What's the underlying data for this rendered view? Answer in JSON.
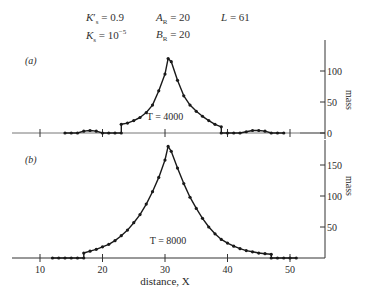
{
  "params": {
    "ks_prime": "K′s = 0.9",
    "ks": "Ks = 10⁻⁵",
    "ar": "AR = 20",
    "br": "BR = 20",
    "l": "L = 61"
  },
  "axis": {
    "xlabel": "distance, X",
    "ylabel": "mass",
    "x_ticks": [
      10,
      20,
      30,
      40,
      50
    ]
  },
  "chart_data": [
    {
      "type": "line",
      "panel_label": "(a)",
      "annotation": "T = 4000",
      "title": "",
      "xlabel": "distance, X",
      "ylabel": "mass",
      "xlim": [
        6,
        56
      ],
      "ylim": [
        0,
        150
      ],
      "y_ticks": [
        0,
        50,
        100
      ],
      "x_ticks": [
        10,
        20,
        30,
        40,
        50
      ],
      "grid": false,
      "x": [
        14,
        15,
        16,
        17,
        18,
        19,
        20,
        21,
        22,
        23,
        23,
        24,
        25,
        26,
        27,
        28,
        29,
        30,
        30.5,
        31,
        32,
        33,
        34,
        35,
        36,
        37,
        38,
        39,
        39,
        40,
        41,
        42,
        43,
        44,
        45,
        46,
        47,
        48,
        49
      ],
      "values": [
        0,
        0,
        0,
        3,
        4,
        3,
        0,
        0,
        0,
        0,
        14,
        16,
        20,
        25,
        33,
        45,
        68,
        95,
        120,
        115,
        85,
        60,
        45,
        35,
        27,
        20,
        14,
        10,
        0,
        0,
        0,
        0,
        2,
        4,
        4,
        3,
        0,
        0,
        0
      ]
    },
    {
      "type": "line",
      "panel_label": "(b)",
      "annotation": "T = 8000",
      "title": "",
      "xlabel": "distance, X",
      "ylabel": "mass",
      "xlim": [
        6,
        56
      ],
      "ylim": [
        0,
        200
      ],
      "y_ticks": [
        50,
        100,
        150
      ],
      "x_ticks": [
        10,
        20,
        30,
        40,
        50
      ],
      "grid": false,
      "x": [
        12,
        13,
        14,
        15,
        16,
        17,
        17,
        18,
        19,
        20,
        21,
        22,
        23,
        24,
        25,
        26,
        27,
        28,
        29,
        30,
        30.5,
        31,
        32,
        33,
        34,
        35,
        36,
        37,
        38,
        39,
        40,
        41,
        42,
        43,
        44,
        45,
        46,
        47,
        47,
        48,
        49,
        50,
        51
      ],
      "values": [
        0,
        0,
        0,
        0,
        0,
        0,
        8,
        11,
        14,
        18,
        22,
        28,
        36,
        45,
        57,
        70,
        87,
        107,
        130,
        158,
        180,
        172,
        145,
        120,
        98,
        80,
        64,
        50,
        39,
        30,
        24,
        19,
        15,
        12,
        10,
        8,
        7,
        6,
        0,
        0,
        0,
        0,
        0
      ]
    }
  ]
}
